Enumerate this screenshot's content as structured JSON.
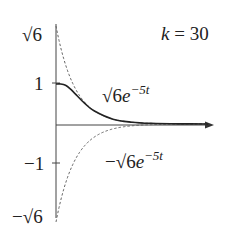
{
  "chart_data": {
    "type": "line",
    "title": "",
    "annotation": "k = 30",
    "annotation_parts": {
      "var": "k",
      "eq": " = 30"
    },
    "xlabel": "t",
    "ylabel": "",
    "ylim": [
      -2.449,
      2.449
    ],
    "xlim": [
      0,
      1.6
    ],
    "grid": false,
    "legend": "none",
    "y_ticks": [
      {
        "value": 2.449,
        "label": "√6",
        "tick": false
      },
      {
        "value": 1,
        "label": "1",
        "tick": true
      },
      {
        "value": -1,
        "label": "−1",
        "tick": true
      },
      {
        "value": -2.449,
        "label": "−√6",
        "tick": false
      }
    ],
    "series": [
      {
        "name": "√6e^{-5t}",
        "style": "dashed",
        "formula": "sqrt(6)*exp(-5t)",
        "x": [
          0,
          0.1,
          0.2,
          0.3,
          0.4,
          0.6,
          0.8,
          1.0,
          1.3,
          1.6
        ],
        "values": [
          2.449,
          1.486,
          0.901,
          0.546,
          0.331,
          0.122,
          0.045,
          0.017,
          0.004,
          0.001
        ]
      },
      {
        "name": "−√6e^{-5t}",
        "style": "dashed",
        "formula": "-sqrt(6)*exp(-5t)",
        "x": [
          0,
          0.1,
          0.2,
          0.3,
          0.4,
          0.6,
          0.8,
          1.0,
          1.3,
          1.6
        ],
        "values": [
          -2.449,
          -1.486,
          -0.901,
          -0.546,
          -0.331,
          -0.122,
          -0.045,
          -0.017,
          -0.004,
          -0.001
        ]
      },
      {
        "name": "solution (k = 30)",
        "style": "solid",
        "x": [
          0,
          0.05,
          0.1,
          0.15,
          0.2,
          0.3,
          0.4,
          0.6,
          0.8,
          1.0,
          1.3,
          1.6
        ],
        "values": [
          1.0,
          1.0,
          0.97,
          0.88,
          0.76,
          0.52,
          0.33,
          0.12,
          0.045,
          0.017,
          0.004,
          0.001
        ]
      }
    ],
    "curve_labels": {
      "upper": {
        "base": "√6",
        "e": "e",
        "exp": "−5t"
      },
      "lower": {
        "base": "−√6",
        "e": "e",
        "exp": "−5t"
      }
    }
  }
}
